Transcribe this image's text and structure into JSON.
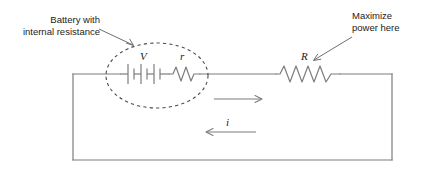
{
  "diagram": {
    "title_annotations": {
      "battery_line1": "Battery with",
      "battery_line2": "internal resistance",
      "power_line1": "Maximize",
      "power_line2": "power here"
    },
    "component_labels": {
      "voltage": "V",
      "internal_resistance": "r",
      "load_resistance": "R",
      "current": "i"
    },
    "colors": {
      "wire": "#7d7d7d",
      "text": "#1b1b1b",
      "dashed_outline": "#4a4a4a"
    },
    "components": [
      {
        "name": "battery",
        "label": "V",
        "cells": 3
      },
      {
        "name": "internal-resistor",
        "label": "r",
        "zigzags": 3
      },
      {
        "name": "load-resistor",
        "label": "R",
        "zigzags": 6
      }
    ],
    "current_direction": "counterclockwise"
  }
}
